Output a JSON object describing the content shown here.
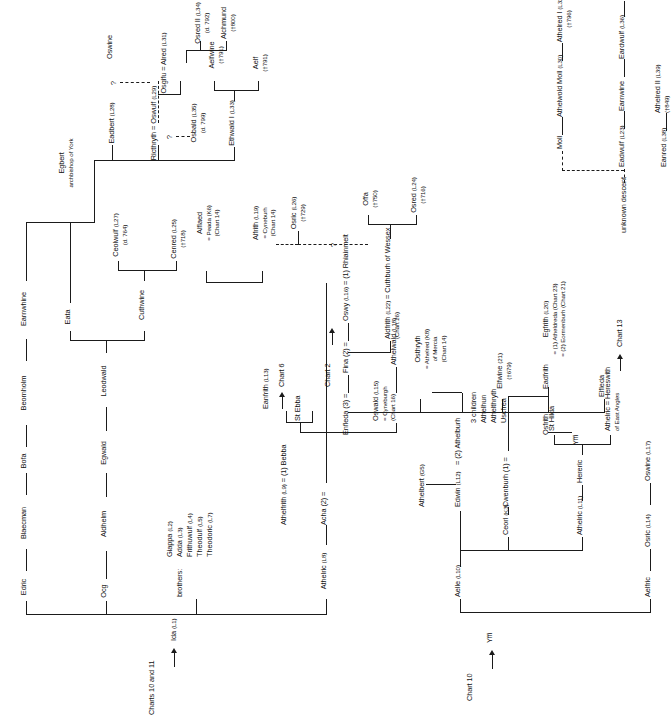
{
  "chart": {
    "top_label": "Charts 10 and 11",
    "chart10_label": "Chart 10",
    "brothers_label": "brothers:",
    "unknown_descent_label": "unknown descent",
    "question_mark": "?"
  },
  "nodes": {
    "ida": {
      "name": "Ida",
      "ref": "(L1)"
    },
    "edric": {
      "name": "Edric"
    },
    "blaecman": {
      "name": "Blaecman"
    },
    "bofa": {
      "name": "Bofa"
    },
    "beornholm": {
      "name": "Beornholm"
    },
    "earnwhine": {
      "name": "Earnwhine"
    },
    "ocg": {
      "name": "Ocg"
    },
    "aldhelm": {
      "name": "Aldhelm"
    },
    "egwald": {
      "name": "Egwald"
    },
    "leodwald": {
      "name": "Leodwald"
    },
    "eata": {
      "name": "Eata"
    },
    "cuthwine": {
      "name": "Cuthwine"
    },
    "ceolwulf": {
      "name": "Ceolwulf",
      "ref": "(L27)",
      "sub": "(d. 764)"
    },
    "cenred": {
      "name": "Cenred",
      "ref": "(L25)",
      "sub": "(†718)"
    },
    "egbert": {
      "name": "Egbert",
      "sub": "archbishop of York"
    },
    "eadbert": {
      "name": "Eadbert",
      "ref": "(L28)"
    },
    "oswulf": {
      "name": "Ricthryth = Oswulf",
      "ref": "(L29)"
    },
    "oswine": {
      "name": "Oswine"
    },
    "osgifu_alred": {
      "name": "Osgifu = Alred",
      "ref": "(L31)"
    },
    "alchmund": {
      "name": "Alchmund",
      "sub": "(†800)"
    },
    "osred2": {
      "name": "Osred II",
      "ref": "(L34)",
      "sub": "(d. 792)"
    },
    "osbald": {
      "name": "Osbald",
      "ref": "(L35)",
      "sub": "(d. 799)"
    },
    "ethwald1": {
      "name": "Ethwald I",
      "ref": "(L33)"
    },
    "aelfwine": {
      "name": "Aelfwine",
      "sub": "(†791)"
    },
    "aelf": {
      "name": "Aelf",
      "sub": "(†791)"
    },
    "alflaed_peada": {
      "name": "Alflaed",
      "sub1": "= Peada (K6)",
      "sub2": "(Chart 14)"
    },
    "alfrith_cyneburh": {
      "name": "Alfrith",
      "ref": "(L19)",
      "sub1": "= Cyneburh",
      "sub2": "(Chart 14)"
    },
    "osric": {
      "name": "Osric",
      "ref": "(L26)",
      "sub": "(†729)"
    },
    "brothers_list": "Giappa (L2)\nAdda (L3)\nFrithuwulf (L4)\nTheodulf (L5)\nTheodoric (L7)",
    "brothers": [
      {
        "name": "Giappa",
        "ref": "(L2)"
      },
      {
        "name": "Adda",
        "ref": "(L3)"
      },
      {
        "name": "Frithuwulf",
        "ref": "(L4)"
      },
      {
        "name": "Theodulf",
        "ref": "(L5)"
      },
      {
        "name": "Theodoric",
        "ref": "(L7)"
      }
    ],
    "athelric": {
      "name": "Athelric",
      "ref": "(L8)"
    },
    "athelfrith_bebba": {
      "name": "Athelfrith",
      "ref": "(L9)",
      "tail": "= (1) Bebba"
    },
    "acha": {
      "name": "Acha (2) ="
    },
    "eanfrith": {
      "name": "Eanfrith",
      "ref": "(L13)"
    },
    "chart6": {
      "name": "Chart 6"
    },
    "chart2": {
      "name": "Chart 2"
    },
    "st_ebba": {
      "name": "St Ebba"
    },
    "oswald": {
      "name": "Oswald",
      "ref": "(L15)",
      "sub1": "= Cyneburgh",
      "sub2": "(Chart 16)"
    },
    "athelwald": {
      "name": "Athelwald",
      "ref": "(L18)"
    },
    "oswy": {
      "name": "Oswy",
      "ref": "(L16)",
      "tail": "= (1) Rhiainmelt"
    },
    "fina": {
      "name": "Fina (2) ="
    },
    "enfleda": {
      "name": "Enfleda (3) ="
    },
    "aldfrith_cuthburh": {
      "name": "Aldfrith",
      "ref": "(L22)",
      "tail": "= Cuthburh of Wessex",
      "sub": "(Chart 26)"
    },
    "osred": {
      "name": "Osred",
      "ref": "(L24)",
      "sub": "(†716)"
    },
    "offa": {
      "name": "Offa",
      "sub": "(†750)"
    },
    "osthryth": {
      "name": "Osthryth",
      "sub1": "= Athelred (K8)",
      "sub2": "of Mercia",
      "sub3": "(Chart 14)"
    },
    "athelbert": {
      "name": "Athelbert",
      "ref": "(G5)"
    },
    "athelburh": {
      "name": "= (2) Athelburh"
    },
    "three_children": {
      "line1": "3 children",
      "line2": "Athelhun",
      "line3": "Athelthryth",
      "line4": "Uscfrea"
    },
    "edwin": {
      "name": "Edwin",
      "ref": "(L12)"
    },
    "cwenburh": {
      "name": "Cwenburh (1) ="
    },
    "ceorl": {
      "name": "Ceorl",
      "ref": "(K3)"
    },
    "osfrith": {
      "name": "Osfrith"
    },
    "eadfrith": {
      "name": "Eadfrith"
    },
    "yffi_low": {
      "name": "Yffi"
    },
    "aelle": {
      "name": "Aelle",
      "ref": "(L10)"
    },
    "yffi_top": {
      "name": "Yffi"
    },
    "aelfric": {
      "name": "Aelfric"
    },
    "osric_l14": {
      "name": "Osric",
      "ref": "(L14)"
    },
    "oswine_l17": {
      "name": "Oswine",
      "ref": "(L17)"
    },
    "athelric_l11": {
      "name": "Athelric",
      "ref": "(L11)"
    },
    "hereric": {
      "name": "Hereric"
    },
    "hereswith": {
      "name": "Athelric = Hereswith",
      "sub": "of East Angles"
    },
    "st_hilda": {
      "name": "St Hilda"
    },
    "chart13": {
      "name": "Chart 13"
    },
    "elfwine": {
      "name": "Elfwine",
      "ref": "(21)",
      "sub": "(†679)"
    },
    "egfrith": {
      "name": "Egfrith",
      "ref": "(L20)",
      "sub1": "= (1) Atheldreda (Chart 23)",
      "sub2": "= (2) Eormenburh (Chart 21)"
    },
    "elfleda": {
      "name": "Elfleda"
    },
    "moll": {
      "name": "Moll"
    },
    "athelwold_moll": {
      "name": "Athelwold Moll",
      "ref": "(L30)"
    },
    "athelred1": {
      "name": "Athelred I",
      "ref": "(L32)",
      "sub": "(†796)"
    },
    "eadwulf": {
      "name": "Eadwulf",
      "ref": "(L23)"
    },
    "earnwine": {
      "name": "Earnwine"
    },
    "eardwulf": {
      "name": "Eardwulf",
      "ref": "(L36)"
    },
    "eanred": {
      "name": "Eanred",
      "ref": "(L38)"
    },
    "athelred2": {
      "name": "Athelred II",
      "ref": "(L39)",
      "sub": "(†849)"
    }
  },
  "colors": {
    "line": "#1b1b1b",
    "text": "#111111",
    "background": "#ffffff"
  }
}
